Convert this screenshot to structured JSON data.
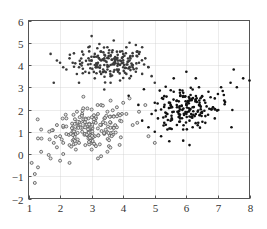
{
  "chart_data": {
    "type": "scatter",
    "title": "",
    "xlabel": "",
    "ylabel": "",
    "xlim": [
      1,
      8
    ],
    "ylim": [
      -2,
      6
    ],
    "xticks": [
      1,
      2,
      3,
      4,
      5,
      6,
      7,
      8
    ],
    "yticks": [
      -2,
      -1,
      0,
      1,
      2,
      3,
      4,
      5,
      6
    ],
    "grid": true,
    "legend": null,
    "series": [
      {
        "name": "cluster-top",
        "marker": "filled-dot",
        "color": "#3a3a3a",
        "center": [
          3.6,
          4.1
        ],
        "spread": [
          0.75,
          0.45
        ],
        "count": 200,
        "points": [
          [
            1.7,
            4.5
          ],
          [
            1.9,
            4.2
          ],
          [
            2.0,
            4.1
          ],
          [
            2.1,
            3.9
          ],
          [
            2.2,
            3.8
          ],
          [
            2.3,
            4.3
          ],
          [
            2.4,
            4.1
          ],
          [
            2.6,
            3.9
          ],
          [
            2.7,
            4.6
          ],
          [
            2.8,
            3.7
          ],
          [
            2.9,
            4.8
          ],
          [
            3.0,
            5.3
          ],
          [
            3.0,
            4.2
          ],
          [
            3.1,
            3.4
          ],
          [
            3.1,
            4.5
          ],
          [
            3.2,
            3.9
          ],
          [
            3.3,
            4.6
          ],
          [
            3.3,
            3.6
          ],
          [
            3.4,
            4.3
          ],
          [
            3.4,
            2.9
          ],
          [
            3.5,
            4.0
          ],
          [
            3.5,
            4.8
          ],
          [
            3.6,
            3.5
          ],
          [
            3.6,
            4.4
          ],
          [
            3.7,
            4.1
          ],
          [
            3.7,
            5.1
          ],
          [
            3.8,
            3.8
          ],
          [
            3.8,
            4.6
          ],
          [
            3.9,
            4.2
          ],
          [
            3.9,
            3.3
          ],
          [
            4.0,
            4.5
          ],
          [
            4.0,
            3.9
          ],
          [
            4.1,
            4.8
          ],
          [
            4.1,
            3.6
          ],
          [
            4.2,
            4.2
          ],
          [
            4.2,
            5.0
          ],
          [
            4.3,
            3.9
          ],
          [
            4.3,
            4.4
          ],
          [
            4.4,
            3.7
          ],
          [
            4.4,
            4.9
          ],
          [
            4.5,
            4.1
          ],
          [
            4.6,
            3.6
          ],
          [
            4.7,
            4.3
          ],
          [
            4.8,
            3.9
          ],
          [
            4.9,
            3.5
          ],
          [
            5.0,
            3.2
          ],
          [
            3.2,
            4.1
          ],
          [
            3.4,
            4.0
          ],
          [
            3.6,
            4.0
          ],
          [
            3.8,
            4.3
          ],
          [
            4.0,
            4.1
          ],
          [
            3.5,
            3.8
          ],
          [
            3.7,
            3.7
          ],
          [
            3.9,
            4.6
          ],
          [
            3.3,
            4.2
          ],
          [
            3.1,
            4.0
          ],
          [
            2.9,
            4.3
          ],
          [
            2.7,
            4.1
          ],
          [
            4.5,
            4.5
          ],
          [
            4.6,
            4.8
          ],
          [
            1.8,
            3.2
          ],
          [
            2.6,
            3.2
          ],
          [
            3.6,
            3.2
          ],
          [
            4.2,
            3.4
          ]
        ]
      },
      {
        "name": "cluster-right",
        "marker": "filled-dot",
        "color": "#111111",
        "center": [
          6.0,
          2.1
        ],
        "spread": [
          0.7,
          0.6
        ],
        "count": 200,
        "points": [
          [
            4.6,
            1.5
          ],
          [
            4.8,
            1.2
          ],
          [
            4.9,
            1.8
          ],
          [
            5.0,
            1.0
          ],
          [
            5.0,
            2.3
          ],
          [
            5.1,
            1.6
          ],
          [
            5.2,
            0.8
          ],
          [
            5.2,
            2.0
          ],
          [
            5.3,
            1.4
          ],
          [
            5.3,
            2.6
          ],
          [
            5.4,
            1.8
          ],
          [
            5.4,
            1.1
          ],
          [
            5.5,
            2.2
          ],
          [
            5.5,
            1.5
          ],
          [
            5.6,
            2.8
          ],
          [
            5.6,
            1.9
          ],
          [
            5.7,
            1.3
          ],
          [
            5.7,
            2.4
          ],
          [
            5.8,
            2.0
          ],
          [
            5.8,
            1.6
          ],
          [
            5.9,
            2.6
          ],
          [
            5.9,
            1.1
          ],
          [
            6.0,
            2.2
          ],
          [
            6.0,
            1.8
          ],
          [
            6.1,
            2.5
          ],
          [
            6.1,
            1.5
          ],
          [
            6.2,
            2.1
          ],
          [
            6.2,
            2.9
          ],
          [
            6.3,
            1.8
          ],
          [
            6.3,
            2.4
          ],
          [
            6.4,
            2.2
          ],
          [
            6.4,
            3.0
          ],
          [
            6.5,
            1.9
          ],
          [
            6.5,
            2.6
          ],
          [
            6.6,
            2.3
          ],
          [
            6.7,
            2.8
          ],
          [
            6.8,
            2.0
          ],
          [
            6.9,
            2.5
          ],
          [
            7.0,
            2.7
          ],
          [
            7.1,
            3.0
          ],
          [
            7.2,
            2.4
          ],
          [
            7.4,
            3.2
          ],
          [
            7.6,
            3.0
          ],
          [
            7.8,
            3.4
          ],
          [
            8.0,
            3.3
          ],
          [
            6.0,
            3.7
          ],
          [
            6.3,
            3.4
          ],
          [
            7.5,
            3.8
          ],
          [
            5.6,
            3.4
          ],
          [
            6.2,
            1.2
          ],
          [
            6.6,
            1.4
          ],
          [
            5.9,
            0.6
          ],
          [
            6.1,
            0.4
          ],
          [
            6.9,
            1.6
          ]
        ]
      },
      {
        "name": "cluster-bottom-left",
        "marker": "hollow-circle",
        "color": "#555555",
        "center": [
          3.0,
          1.1
        ],
        "spread": [
          0.8,
          0.6
        ],
        "count": 200,
        "points": [
          [
            1.1,
            -0.4
          ],
          [
            1.2,
            -0.9
          ],
          [
            1.2,
            -1.3
          ],
          [
            1.3,
            0.7
          ],
          [
            1.3,
            -0.6
          ],
          [
            1.4,
            1.1
          ],
          [
            1.4,
            0.1
          ],
          [
            1.7,
            -0.2
          ],
          [
            1.8,
            0.5
          ],
          [
            1.9,
            1.3
          ],
          [
            1.9,
            0.3
          ],
          [
            2.0,
            -0.3
          ],
          [
            2.0,
            0.8
          ],
          [
            2.1,
            0.0
          ],
          [
            2.1,
            0.5
          ],
          [
            2.2,
            0.9
          ],
          [
            2.3,
            -0.4
          ],
          [
            2.3,
            0.4
          ],
          [
            2.4,
            1.2
          ],
          [
            2.4,
            0.6
          ],
          [
            2.5,
            0.2
          ],
          [
            2.5,
            0.9
          ],
          [
            2.6,
            1.4
          ],
          [
            2.6,
            0.5
          ],
          [
            2.7,
            1.0
          ],
          [
            2.7,
            1.8
          ],
          [
            2.8,
            0.4
          ],
          [
            2.8,
            1.3
          ],
          [
            2.9,
            1.6
          ],
          [
            2.9,
            0.7
          ],
          [
            3.0,
            1.1
          ],
          [
            3.0,
            2.0
          ],
          [
            3.0,
            0.2
          ],
          [
            3.1,
            1.5
          ],
          [
            3.1,
            0.8
          ],
          [
            3.2,
            1.8
          ],
          [
            3.2,
            -0.2
          ],
          [
            3.3,
            1.3
          ],
          [
            3.3,
            2.2
          ],
          [
            3.4,
            0.9
          ],
          [
            3.4,
            1.6
          ],
          [
            3.5,
            1.9
          ],
          [
            3.5,
            0.1
          ],
          [
            3.6,
            1.4
          ],
          [
            3.6,
            2.4
          ],
          [
            3.7,
            1.7
          ],
          [
            3.8,
            1.2
          ],
          [
            3.8,
            2.1
          ],
          [
            3.9,
            1.5
          ],
          [
            4.0,
            2.3
          ],
          [
            4.1,
            1.8
          ],
          [
            4.2,
            2.5
          ],
          [
            4.3,
            1.3
          ],
          [
            4.5,
            1.9
          ],
          [
            4.7,
            2.2
          ],
          [
            4.8,
            0.8
          ],
          [
            5.0,
            0.5
          ],
          [
            3.3,
            -0.1
          ],
          [
            3.0,
            0.6
          ],
          [
            2.2,
            1.6
          ]
        ]
      }
    ]
  }
}
